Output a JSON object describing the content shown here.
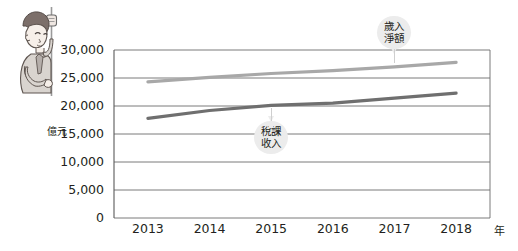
{
  "chart_data": {
    "type": "line",
    "title": "",
    "subtitle": "",
    "xlabel": "年",
    "ylabel": "億元",
    "x": [
      2013,
      2014,
      2015,
      2016,
      2017,
      2018
    ],
    "categories": [
      "2013",
      "2014",
      "2015",
      "2016",
      "2017",
      "2018"
    ],
    "ylim": [
      0,
      30000
    ],
    "ytick_values": [
      30000,
      25000,
      20000,
      15000,
      10000,
      5000,
      0
    ],
    "ytick_labels": [
      "30,000",
      "25,000",
      "20,000",
      "15,000",
      "10,000",
      "5,000",
      "0"
    ],
    "grid": true,
    "grid_axis": "y",
    "legend_position": "inline-callout",
    "series": [
      {
        "name": "歲入淨額",
        "color": "#a8a8a8",
        "values": [
          24300,
          25100,
          25800,
          26300,
          27000,
          27800
        ]
      },
      {
        "name": "稅課收入",
        "color": "#6f6f6f",
        "values": [
          17800,
          19200,
          20100,
          20500,
          21400,
          22300
        ]
      }
    ],
    "annotations": [
      {
        "text": "歲入\n淨額",
        "series": "歲入淨額",
        "at_x": 2017
      },
      {
        "text": "稅課\n收入",
        "series": "稅課收入",
        "at_x": 2015
      }
    ]
  },
  "axes": {
    "y_unit_label": "億元",
    "x_unit_label": "年"
  },
  "illustration": {
    "name": "boy-climbing-pole",
    "description": "cartoon boy holding onto a vertical pole"
  },
  "colors": {
    "axis": "#595959",
    "grid": "#6b6b6b",
    "text": "#231f20",
    "series_light": "#a8a8a8",
    "series_dark": "#6f6f6f",
    "callout_bg": "#ececec",
    "background": "#ffffff"
  }
}
